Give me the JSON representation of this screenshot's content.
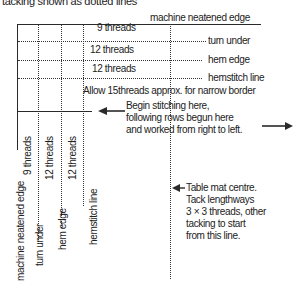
{
  "title": "tacking shown as dotted lines",
  "top_labels": {
    "machine_edge": "machine neatened edge",
    "turn_under": "turn under",
    "hem_edge": "hem edge",
    "hemstitch_line": "hemstitch line"
  },
  "thread_counts_horizontal": [
    "9 threads",
    "12 threads",
    "12 threads"
  ],
  "allow_note": "Allow 15threads approx.  for narrow border",
  "begin_note": {
    "line1": "Begin stitching here,",
    "line2": "following rows begun here",
    "line3": "and worked from right to left."
  },
  "side_labels": {
    "machine_edge": "machine neatened edge",
    "turn_under": "turn under",
    "hem_edge": "hem edge",
    "hemstitch_line": "hemstitch line"
  },
  "thread_counts_vertical": [
    "9 threads",
    "12 threads",
    "12 threads"
  ],
  "centre_note": {
    "line1": "Table mat centre.",
    "line2": "Tack lengthways",
    "line3": "3 × 3 threads, other",
    "line4": "tacking to start",
    "line5": "from this line."
  },
  "colors": {
    "line": "#2a2a2a",
    "text": "#222222",
    "background": "#ffffff"
  }
}
